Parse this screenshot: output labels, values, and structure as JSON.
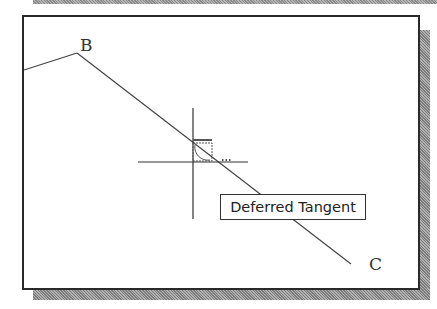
{
  "diagram": {
    "points": {
      "B": {
        "label": "B",
        "x": 77,
        "y": 53
      },
      "C": {
        "label": "C",
        "x": 351,
        "y": 264
      }
    },
    "tooltip": {
      "text": "Deferred Tangent"
    },
    "cursor": {
      "type": "crosshair",
      "x": 193,
      "y": 162
    },
    "snap_marker": {
      "type": "deferred-tangent-icon"
    },
    "colors": {
      "line": "#444444",
      "frame": "#2a2a2a",
      "shadow": "#9a9a9a",
      "background": "#ffffff"
    }
  }
}
